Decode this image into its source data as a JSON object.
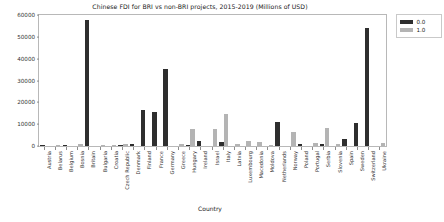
{
  "chart_data": {
    "type": "bar",
    "title": "Chinese FDI for BRI vs non-BRI projects, 2015-2019 (Millions of USD)",
    "xlabel": "Country",
    "ylabel": "",
    "ylim": [
      0,
      60000
    ],
    "yticks": [
      0,
      10000,
      20000,
      30000,
      40000,
      50000,
      60000
    ],
    "ytick_labels": [
      "0",
      "10000",
      "20000",
      "30000",
      "40000",
      "50000",
      "60000"
    ],
    "grid": false,
    "legend_position": "upper right outside",
    "categories": [
      "Austria",
      "Belarus",
      "Belgium",
      "Bosnia",
      "Britain",
      "Bulgaria",
      "Croatia",
      "Czech Republic",
      "Denmark",
      "Finland",
      "France",
      "Germany",
      "Greece",
      "Hungary",
      "Ireland",
      "Israel",
      "Italy",
      "Latvia",
      "Luxembourg",
      "Macedonia",
      "Moldova",
      "Netherlands",
      "Norway",
      "Poland",
      "Portugal",
      "Serbia",
      "Slovenia",
      "Spain",
      "Sweden",
      "Switzerland",
      "Ukraine"
    ],
    "series": [
      {
        "name": "0.0",
        "color": "#2e2e2e",
        "values": [
          300,
          0,
          400,
          0,
          57800,
          0,
          0,
          250,
          700,
          16600,
          15400,
          35500,
          0,
          250,
          2100,
          0,
          2000,
          0,
          0,
          0,
          0,
          11200,
          0,
          900,
          0,
          700,
          0,
          3100,
          10700,
          54000,
          0
        ]
      },
      {
        "name": "1.0",
        "color": "#b4b4b4",
        "values": [
          0,
          600,
          0,
          750,
          0,
          500,
          400,
          900,
          0,
          0,
          0,
          0,
          1000,
          7600,
          0,
          8000,
          14500,
          900,
          2100,
          1800,
          500,
          0,
          6300,
          0,
          1400,
          8100,
          1100,
          0,
          0,
          0,
          1500
        ]
      }
    ]
  },
  "legend": {
    "entries": [
      {
        "label": "0.0",
        "color": "#2e2e2e"
      },
      {
        "label": "1.0",
        "color": "#b4b4b4"
      }
    ]
  }
}
